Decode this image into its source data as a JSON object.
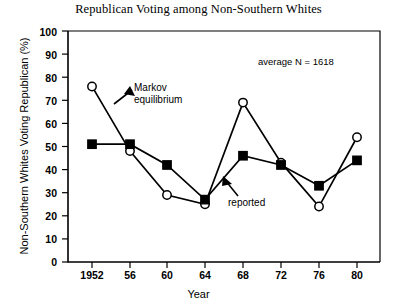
{
  "chart_data": {
    "type": "line",
    "title": "Republican Voting among Non-Southern Whites",
    "xlabel": "Year",
    "ylabel": "Non-Southern Whites Voting Republican (%)",
    "categories": [
      "1952",
      "56",
      "60",
      "64",
      "68",
      "72",
      "76",
      "80"
    ],
    "x_values": [
      1952,
      1956,
      1960,
      1964,
      1968,
      1972,
      1976,
      1980
    ],
    "xlim": [
      1950,
      1982
    ],
    "ylim": [
      0,
      100
    ],
    "y_ticks": [
      "100",
      "90",
      "80",
      "70",
      "60",
      "50",
      "40",
      "30",
      "20",
      "10",
      "0"
    ],
    "y_tick_values": [
      100,
      90,
      80,
      70,
      60,
      50,
      40,
      30,
      20,
      10,
      0
    ],
    "grid": false,
    "legend": "none",
    "series": [
      {
        "name": "Markov equilibrium",
        "marker": "open-circle",
        "values": [
          76,
          48,
          29,
          25,
          69,
          43,
          24,
          54
        ]
      },
      {
        "name": "reported",
        "marker": "filled-square",
        "values": [
          51,
          51,
          42,
          27,
          46,
          42,
          33,
          44
        ]
      }
    ],
    "annotations": [
      {
        "id": "markov",
        "text_line1": "Markov",
        "text_line2": "equilibrium"
      },
      {
        "id": "reported",
        "text": "reported"
      },
      {
        "id": "average_n",
        "text": "average  N = 1618"
      }
    ]
  },
  "colors": {
    "axis": "#000000",
    "series_line": "#000000",
    "marker_fill_open": "#ffffff",
    "marker_fill_solid": "#000000",
    "background": "#ffffff"
  }
}
